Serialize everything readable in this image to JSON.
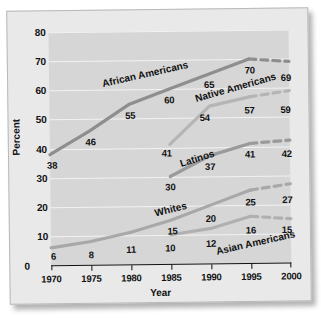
{
  "chart_data": {
    "type": "line",
    "title": "",
    "xlabel": "Year",
    "ylabel": "Percent",
    "x": [
      1970,
      1975,
      1980,
      1985,
      1990,
      1995,
      2000
    ],
    "xlim": [
      1970,
      2000
    ],
    "ylim": [
      0,
      80
    ],
    "ytick_labels": [
      "0",
      "10",
      "20",
      "30",
      "40",
      "50",
      "60",
      "70",
      "80"
    ],
    "yticks": [
      0,
      10,
      20,
      30,
      40,
      50,
      60,
      70,
      80
    ],
    "xtick_labels": [
      "1970",
      "1975",
      "1980",
      "1985",
      "1990",
      "1995",
      "2000"
    ],
    "grid": "horizontal-white",
    "legend": "inline-series-labels",
    "note_dashed": "Segment from 1995 to 2000 is dashed (projected)",
    "series": [
      {
        "name": "African Americans",
        "color": "#8e8e8e",
        "x": [
          1970,
          1975,
          1980,
          1985,
          1990,
          1995,
          2000
        ],
        "values": [
          38,
          46,
          55,
          60,
          65,
          70,
          69
        ],
        "label_angle": -12,
        "label_x": 1976.6,
        "label_y": 62
      },
      {
        "name": "Native Americans",
        "color": "#b5b5b5",
        "x": [
          1985,
          1990,
          1995,
          2000
        ],
        "values": [
          41,
          54,
          57,
          59
        ],
        "label_angle": -15,
        "label_x": 1988.3,
        "label_y": 56.5
      },
      {
        "name": "Latinos",
        "color": "#9a9a9a",
        "x": [
          1985,
          1990,
          1995,
          2000
        ],
        "values": [
          30,
          37,
          41,
          42
        ],
        "label_angle": -17,
        "label_x": 1986.3,
        "label_y": 34.5
      },
      {
        "name": "Whites",
        "color": "#a8a8a8",
        "x": [
          1970,
          1975,
          1980,
          1985,
          1990,
          1995,
          2000
        ],
        "values": [
          6,
          8,
          11,
          15,
          20,
          25,
          27
        ],
        "label_angle": -13,
        "label_x": 1983.0,
        "label_y": 17.5
      },
      {
        "name": "Asian Americans",
        "color": "#b0b0b0",
        "x": [
          1985,
          1990,
          1995,
          2000
        ],
        "values": [
          10,
          12,
          16,
          15
        ],
        "label_angle": -12,
        "label_x": 1990.6,
        "label_y": 4.0
      }
    ],
    "point_labels": [
      {
        "series": "African Americans",
        "text": "38",
        "x": 1970.25,
        "y": 34.4
      },
      {
        "series": "African Americans",
        "text": "46",
        "x": 1975.1,
        "y": 42.4
      },
      {
        "series": "African Americans",
        "text": "55",
        "x": 1980.1,
        "y": 51.2
      },
      {
        "series": "African Americans",
        "text": "60",
        "x": 1985.0,
        "y": 56.3
      },
      {
        "series": "African Americans",
        "text": "65",
        "x": 1990.0,
        "y": 61.4
      },
      {
        "series": "African Americans",
        "text": "70",
        "x": 1995.1,
        "y": 66.3
      },
      {
        "series": "African Americans",
        "text": "69",
        "x": 1999.6,
        "y": 63.6
      },
      {
        "series": "Native Americans",
        "text": "41",
        "x": 1984.6,
        "y": 38.0
      },
      {
        "series": "Native Americans",
        "text": "54",
        "x": 1989.4,
        "y": 50.3
      },
      {
        "series": "Native Americans",
        "text": "57",
        "x": 1995.0,
        "y": 52.6
      },
      {
        "series": "Native Americans",
        "text": "59",
        "x": 1999.5,
        "y": 52.6
      },
      {
        "series": "Latinos",
        "text": "30",
        "x": 1985.0,
        "y": 26.3
      },
      {
        "series": "Latinos",
        "text": "37",
        "x": 1990.0,
        "y": 33.3
      },
      {
        "series": "Latinos",
        "text": "41",
        "x": 1995.0,
        "y": 37.4
      },
      {
        "series": "Latinos",
        "text": "42",
        "x": 1999.6,
        "y": 37.4
      },
      {
        "series": "Whites",
        "text": "6",
        "x": 1970.3,
        "y": 3.0
      },
      {
        "series": "Whites",
        "text": "8",
        "x": 1975.0,
        "y": 3.6
      },
      {
        "series": "Whites",
        "text": "11",
        "x": 1980.0,
        "y": 5.1
      },
      {
        "series": "Whites",
        "text": "15",
        "x": 1985.2,
        "y": 11.4
      },
      {
        "series": "Whites",
        "text": "20",
        "x": 1990.0,
        "y": 15.6
      },
      {
        "series": "Whites",
        "text": "25",
        "x": 1995.0,
        "y": 21.0
      },
      {
        "series": "Whites",
        "text": "27",
        "x": 1999.6,
        "y": 21.8
      },
      {
        "series": "Asian Americans",
        "text": "10",
        "x": 1984.9,
        "y": 5.6
      },
      {
        "series": "Asian Americans",
        "text": "12",
        "x": 1990.0,
        "y": 7.0
      },
      {
        "series": "Asian Americans",
        "text": "16",
        "x": 1995.0,
        "y": 11.3
      },
      {
        "series": "Asian Americans",
        "text": "15",
        "x": 1999.5,
        "y": 11.3
      }
    ]
  }
}
